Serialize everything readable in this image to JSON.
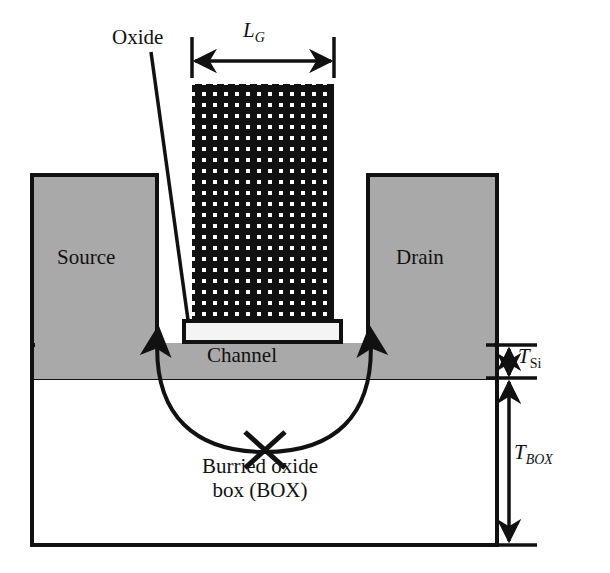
{
  "figure": {
    "type": "cross-section-schematic"
  },
  "labels": {
    "oxide": "Oxide",
    "source": "Source",
    "drain": "Drain",
    "channel": "Channel",
    "box_line1": "Burried oxide",
    "box_line2": "box (BOX)"
  },
  "dimensions": {
    "gate_length": {
      "symbol": "L",
      "subscript": "G"
    },
    "silicon_thickness": {
      "symbol": "T",
      "subscript": "Si"
    },
    "box_thickness": {
      "symbol": "T",
      "subscript": "BOX"
    }
  },
  "colors": {
    "background": "#ffffff",
    "outline": "#111111",
    "silicon_gray": "#a9a9a9",
    "gate_fill": "#111111",
    "gate_dot": "#ffffff",
    "oxide_fill": "#f2f2f2"
  },
  "geometry": {
    "gate": {
      "x": 192,
      "y": 84,
      "width": 142,
      "height": 238
    },
    "gate_oxide": {
      "x": 184,
      "y": 322,
      "width": 157,
      "height": 19
    },
    "source": {
      "x": 32,
      "y": 175,
      "width": 125,
      "height": 168
    },
    "drain": {
      "x": 368,
      "y": 175,
      "width": 129,
      "height": 168
    },
    "silicon_layer": {
      "x": 32,
      "y": 343,
      "width": 465,
      "height": 35
    },
    "box": {
      "x": 32,
      "y": 378,
      "width": 465,
      "height": 167
    }
  }
}
